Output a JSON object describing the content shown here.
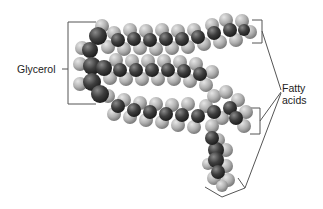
{
  "figure": {
    "labels": {
      "glycerol": "Glycerol",
      "fatty_line1": "Fatty",
      "fatty_line2": "acids"
    },
    "colors": {
      "carbon": "#3c3c3c",
      "hydrogen": "#b4b4b4",
      "line": "#444444",
      "background": "#ffffff"
    }
  }
}
